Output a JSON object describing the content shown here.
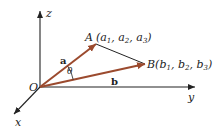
{
  "diagram": {
    "type": "3d-vector-angle",
    "colors": {
      "axis": "#222222",
      "vector": "#9b4a2e",
      "segment": "#222222"
    },
    "axes": {
      "x_label": "x",
      "y_label": "y",
      "z_label": "z"
    },
    "origin_label": "O",
    "angle_label": "θ",
    "vectors": [
      {
        "name": "a",
        "to": "A"
      },
      {
        "name": "b",
        "to": "B"
      }
    ],
    "points": {
      "A": {
        "letter": "A",
        "coords": [
          "a",
          "a",
          "a"
        ],
        "subs": [
          "1",
          "2",
          "3"
        ]
      },
      "B": {
        "letter": "B",
        "coords": [
          "b",
          "b",
          "b"
        ],
        "subs": [
          "1",
          "2",
          "3"
        ]
      }
    }
  }
}
